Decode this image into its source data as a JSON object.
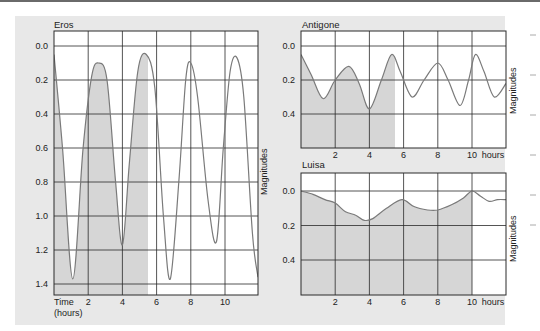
{
  "chart_data": [
    {
      "type": "line",
      "title": "Eros",
      "xlabel": "Time (hours)",
      "ylabel": "Magnitudes",
      "y_inverted": true,
      "ylim": [
        1.45,
        -0.05
      ],
      "xlim": [
        0,
        12
      ],
      "x_ticks": [
        2,
        4,
        6,
        8,
        10
      ],
      "y_ticks": [
        "0.0",
        "0.2",
        "0.4",
        "0.6",
        "0.8",
        "1.0",
        "1.2",
        "1.4"
      ],
      "grid": true,
      "shaded_until_hours": 5.5,
      "x": [
        0,
        0.5,
        1.1,
        1.7,
        2.2,
        2.6,
        3.1,
        3.6,
        4.0,
        4.4,
        4.9,
        5.4,
        5.9,
        6.4,
        6.8,
        7.3,
        7.7,
        8.0,
        8.4,
        9.0,
        9.5,
        9.9,
        10.3,
        10.7,
        11.1,
        11.6,
        12.0
      ],
      "series": [
        {
          "name": "Eros light curve",
          "values": [
            0.05,
            0.6,
            1.37,
            0.6,
            0.18,
            0.1,
            0.2,
            0.8,
            1.17,
            0.7,
            0.15,
            0.05,
            0.25,
            1.0,
            1.37,
            0.8,
            0.2,
            0.1,
            0.3,
            0.9,
            1.15,
            0.6,
            0.15,
            0.07,
            0.3,
            1.1,
            1.36
          ]
        }
      ]
    },
    {
      "type": "line",
      "title": "Antigone",
      "xlabel": "hours",
      "ylabel": "Magnitudes",
      "y_inverted": true,
      "ylim": [
        0.6,
        -0.05
      ],
      "xlim": [
        0,
        12
      ],
      "x_ticks": [
        2,
        4,
        6,
        8,
        10
      ],
      "y_ticks": [
        "0.0",
        "0.2",
        "0.4"
      ],
      "grid": true,
      "shaded_until_hours": 5.5,
      "x": [
        0,
        0.6,
        1.3,
        2.0,
        2.8,
        3.4,
        4.0,
        4.7,
        5.3,
        5.8,
        6.5,
        7.2,
        8.0,
        8.6,
        9.3,
        9.8,
        10.2,
        10.7,
        11.3,
        12.0
      ],
      "series": [
        {
          "name": "Antigone light curve",
          "values": [
            0.05,
            0.17,
            0.31,
            0.2,
            0.12,
            0.22,
            0.37,
            0.2,
            0.05,
            0.15,
            0.3,
            0.2,
            0.1,
            0.2,
            0.35,
            0.2,
            0.05,
            0.15,
            0.3,
            0.22
          ]
        }
      ]
    },
    {
      "type": "line",
      "title": "Luisa",
      "xlabel": "hours",
      "ylabel": "Magnitudes",
      "y_inverted": true,
      "ylim": [
        0.6,
        -0.05
      ],
      "xlim": [
        0,
        12
      ],
      "x_ticks": [
        2,
        4,
        6,
        8,
        10
      ],
      "y_ticks": [
        "0.0",
        "0.2",
        "0.4"
      ],
      "grid": true,
      "shaded_until_hours": 10,
      "x": [
        0,
        0.7,
        1.4,
        2.0,
        2.6,
        3.2,
        3.7,
        4.2,
        5.0,
        5.9,
        6.6,
        7.4,
        8.0,
        8.8,
        9.5,
        10.0,
        10.5,
        11.0,
        11.5,
        12.0
      ],
      "series": [
        {
          "name": "Luisa light curve",
          "values": [
            0.0,
            0.02,
            0.05,
            0.07,
            0.12,
            0.14,
            0.17,
            0.16,
            0.1,
            0.05,
            0.09,
            0.11,
            0.11,
            0.08,
            0.04,
            0.0,
            0.03,
            0.06,
            0.05,
            0.05
          ]
        }
      ]
    }
  ],
  "charts": {
    "eros": {
      "title": "Eros",
      "ylabel": "Magnitudes",
      "time_label_1": "Time",
      "time_label_2": "(hours)"
    },
    "antigone": {
      "title": "Antigone",
      "ylabel": "Magnitudes",
      "hours_label": "hours"
    },
    "luisa": {
      "title": "Luisa",
      "ylabel": "Magnitudes",
      "hours_label": "hours"
    }
  },
  "colors": {
    "panel_bg": "#e8e8e8",
    "plot_bg": "#ffffff",
    "shade": "#d6d6d6",
    "grid": "#2a2a2a",
    "curve": "#7a7a7a"
  }
}
